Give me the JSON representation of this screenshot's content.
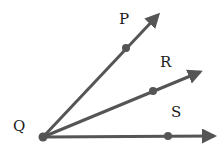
{
  "diagram": {
    "title": "",
    "vertex": {
      "label": "Q"
    },
    "rays": [
      {
        "label": "P",
        "through_point": "P"
      },
      {
        "label": "R",
        "through_point": "R"
      },
      {
        "label": "S",
        "through_point": "S"
      }
    ],
    "colors": {
      "ray": "#555555",
      "label": "#1a1a1a"
    }
  }
}
